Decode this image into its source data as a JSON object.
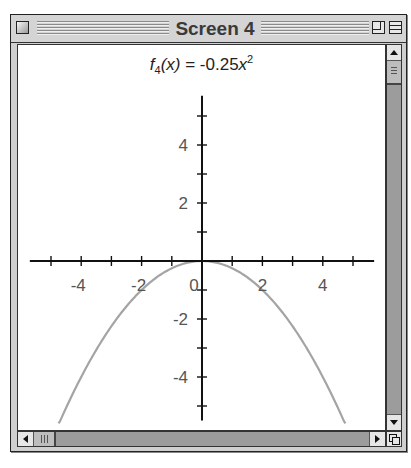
{
  "window": {
    "title": "Screen 4",
    "controls": [
      "close-box",
      "zoom-box",
      "collapse-box"
    ]
  },
  "plot": {
    "title_func": "f",
    "title_sub": "4",
    "title_var": "(x)",
    "title_eq": " = -0.25",
    "title_x": "x",
    "title_pow": "2"
  },
  "scrollbars": {
    "vertical": {
      "up": "arrow-up",
      "down": "arrow-down"
    },
    "horizontal": {
      "left": "arrow-left",
      "right": "arrow-right"
    }
  },
  "colors": {
    "curve": "#a4a4a4",
    "axis": "#111111",
    "tick_label": "#555555"
  },
  "chart_data": {
    "type": "line",
    "function": "-0.25*x^2",
    "xlabel": "",
    "ylabel": "",
    "xlim": [
      -5.6,
      5.6
    ],
    "ylim": [
      -5.6,
      5.6
    ],
    "x_ticks": [
      -5,
      -4,
      -3,
      -2,
      -1,
      1,
      2,
      3,
      4,
      5
    ],
    "x_tick_labels": [
      "-4",
      "-2",
      "0",
      "2",
      "4"
    ],
    "y_ticks": [
      -5,
      -4,
      -3,
      -2,
      -1,
      1,
      2,
      3,
      4,
      5
    ],
    "y_tick_labels": [
      "-4",
      "-2",
      "2",
      "4"
    ],
    "origin_label": "0",
    "grid": false,
    "series": [
      {
        "name": "f4(x)",
        "x": [
          -4.75,
          -4,
          -3,
          -2,
          -1,
          0,
          1,
          2,
          3,
          4,
          4.75
        ],
        "y": [
          -5.64,
          -4,
          -2.25,
          -1,
          -0.25,
          0,
          -0.25,
          -1,
          -2.25,
          -4,
          -5.64
        ]
      }
    ]
  }
}
